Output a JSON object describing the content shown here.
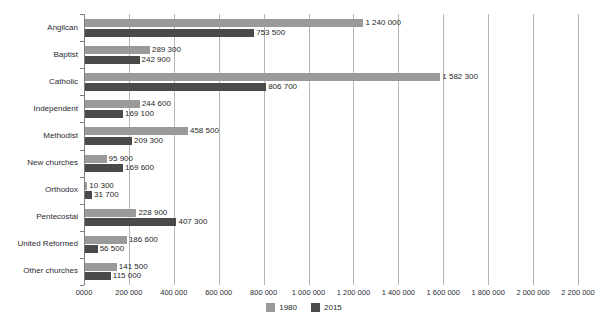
{
  "chart_data": {
    "type": "bar",
    "orientation": "horizontal",
    "title": "",
    "xlabel": "",
    "ylabel": "",
    "xlim": [
      0,
      2200000
    ],
    "grid": true,
    "legend_position": "bottom-center",
    "categories": [
      "Anglican",
      "Baptist",
      "Catholic",
      "Independent",
      "Methodist",
      "New churches",
      "Orthodox",
      "Pentecostal",
      "United Reformed",
      "Other churches"
    ],
    "series": [
      {
        "name": "1980",
        "color": "#9a9a9a",
        "values": [
          1240000,
          289300,
          1582300,
          244600,
          458500,
          95900,
          10300,
          228900,
          186600,
          141500
        ],
        "labels": [
          "1 240 000",
          "289 300",
          "1 582 300",
          "244 600",
          "458 500",
          "95 900",
          "10 300",
          "228 900",
          "186 600",
          "141 500"
        ]
      },
      {
        "name": "2015",
        "color": "#4a4a4a",
        "values": [
          753500,
          242900,
          806700,
          169100,
          209300,
          169600,
          31700,
          407300,
          56500,
          115000
        ],
        "labels": [
          "753 500",
          "242 900",
          "806 700",
          "169 100",
          "209 300",
          "169 600",
          "31 700",
          "407 300",
          "56 500",
          "115 000"
        ]
      }
    ],
    "xticks": [
      0,
      200000,
      400000,
      600000,
      800000,
      1000000,
      1200000,
      1400000,
      1600000,
      1800000,
      2000000,
      2200000
    ],
    "xtick_labels": [
      "0000",
      "200 000",
      "400 000",
      "600 000",
      "800 000",
      "1 000 000",
      "1 200 000",
      "1 400 000",
      "1 600 000",
      "1 800 000",
      "2 000 000",
      "2 200 000"
    ]
  },
  "legend": {
    "entries": [
      {
        "label": "1980",
        "color": "#9a9a9a"
      },
      {
        "label": "2015",
        "color": "#4a4a4a"
      }
    ]
  }
}
